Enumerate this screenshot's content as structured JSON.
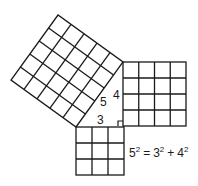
{
  "figure": {
    "triangle": {
      "side_labels": {
        "hypotenuse": "5",
        "vertical_leg": "4",
        "horizontal_leg": "3"
      },
      "right_angle_marker": true
    },
    "squares": [
      {
        "name": "hypotenuse-square",
        "side": 5,
        "grid": "5x5"
      },
      {
        "name": "vertical-leg-square",
        "side": 4,
        "grid": "4x4"
      },
      {
        "name": "horizontal-leg-square",
        "side": 3,
        "grid": "3x3"
      }
    ],
    "equation": {
      "base_a": "5",
      "exp_a": "2",
      "eq": "=",
      "base_b": "3",
      "exp_b": "2",
      "plus": "+",
      "base_c": "4",
      "exp_c": "2"
    },
    "colors": {
      "stroke": "#1a1a1a",
      "background": "#ffffff"
    }
  }
}
